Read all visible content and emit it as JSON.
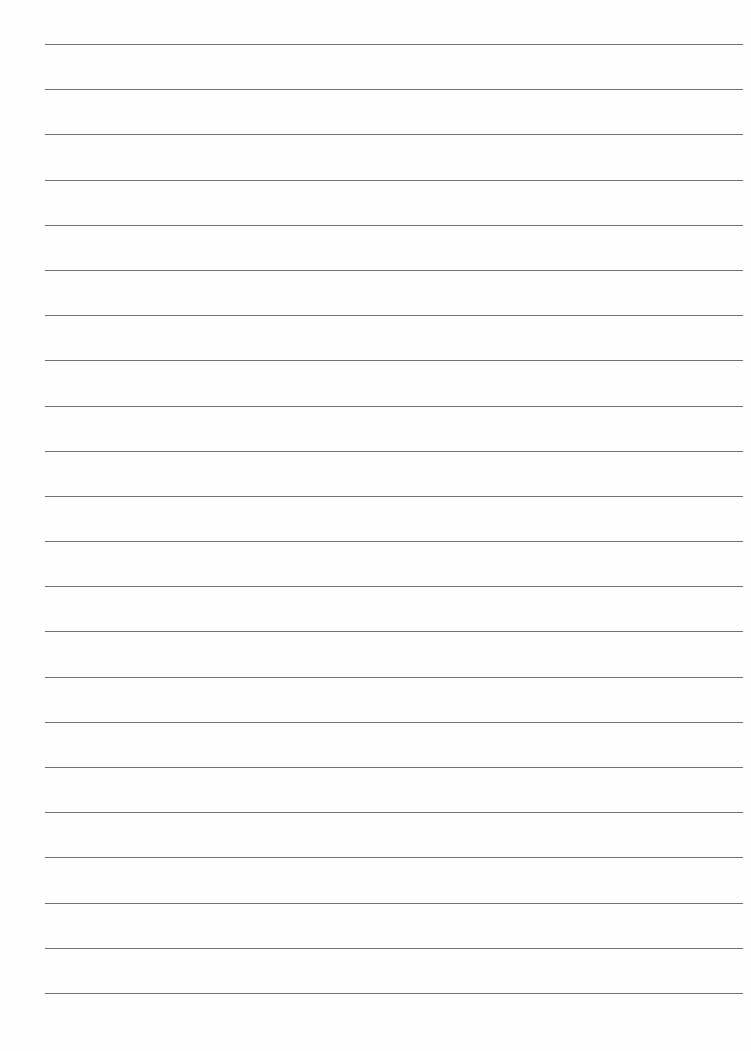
{
  "page": {
    "type": "lined-paper",
    "background_color": "#fefefe",
    "line_color": "#707070",
    "line_count": 22,
    "first_line_y": 44,
    "line_spacing": 45.19,
    "line_left": 45,
    "line_right": 743,
    "text": []
  }
}
